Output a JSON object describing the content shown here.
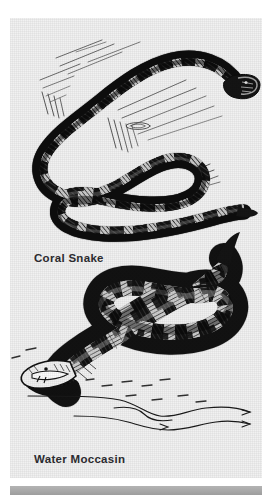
{
  "page": {
    "type": "scanned-book-illustration-plate",
    "background_color": "#ffffff",
    "plate_color": "#f1f1f1",
    "footer_bar_color": "#a8a8a8"
  },
  "figures": [
    {
      "id": "coral-snake",
      "caption": "Coral Snake",
      "subject": "coral snake",
      "description": "Pen-and-ink drawing of a slender banded coral snake coiled in a loose figure-eight on the ground, head at upper right, tail at lower right, with hatched grass and ground strokes behind it.",
      "ink_color": "#111111"
    },
    {
      "id": "water-moccasin",
      "caption": "Water Moccasin",
      "subject": "water moccasin (cottonmouth)",
      "description": "Pen-and-ink drawing of a thick-bodied water moccasin in an S-curve, tail hooked upward at the upper right, head at the lower left with mouth gaped open, resting above drawn water ripple lines.",
      "ink_color": "#111111"
    }
  ],
  "captions": {
    "coral": "Coral Snake",
    "moccasin": "Water Moccasin"
  }
}
